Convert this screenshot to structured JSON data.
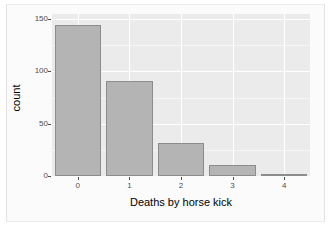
{
  "chart_data": {
    "type": "bar",
    "title": "",
    "xlabel": "Deaths by horse kick",
    "ylabel": "count",
    "categories": [
      "0",
      "1",
      "2",
      "3",
      "4"
    ],
    "values": [
      144,
      91,
      32,
      11,
      2
    ],
    "xlim": [
      -0.5,
      4.5
    ],
    "ylim": [
      0,
      155
    ],
    "y_ticks": [
      0,
      50,
      100,
      150
    ],
    "y_tick_labels": [
      "0",
      "50",
      "100",
      "150"
    ],
    "x_tick_labels": [
      "0",
      "1",
      "2",
      "3",
      "4"
    ],
    "grid": true,
    "legend": "none",
    "series": [
      {
        "name": "count",
        "values": [
          144,
          91,
          32,
          11,
          2
        ]
      }
    ]
  },
  "style": {
    "panel_background": "#ebebeb",
    "grid_major_color": "#ffffff",
    "grid_minor_color": "#f6f6f6",
    "bar_fill": "#b4b4b4",
    "bar_border": "#8c8c8c",
    "axis_text_color": "#4d4d4d",
    "axis_title_color": "#000000",
    "device_background": "#fbfbfb"
  }
}
